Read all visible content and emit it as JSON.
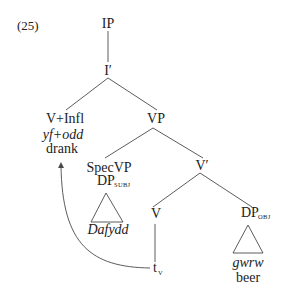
{
  "example_number": "(25)",
  "tree": {
    "root": "IP",
    "i_bar": "I′",
    "v_infl": {
      "category": "V+Infl",
      "welsh": "yf+odd",
      "gloss": "drank"
    },
    "vp": "VP",
    "spec_vp": {
      "label": "SpecVP",
      "dp": "DP",
      "subscript": "SUBJ",
      "welsh": "Dafydd"
    },
    "v_bar": "V′",
    "v": "V",
    "trace": {
      "t": "t",
      "subscript": "V"
    },
    "dp_obj": {
      "dp": "DP",
      "subscript": "OBJ",
      "welsh": "gwrw",
      "gloss": "beer"
    }
  },
  "movement_arrow": {
    "from": "t_V",
    "to": "V+Infl"
  },
  "colors": {
    "text": "#222222",
    "lines": "#4a4a4a",
    "background": "#ffffff"
  }
}
